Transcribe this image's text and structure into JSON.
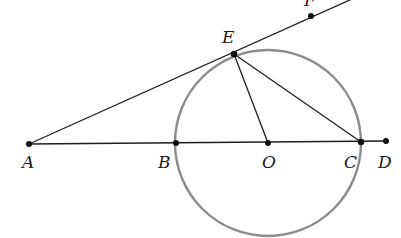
{
  "diagram": {
    "type": "geometry",
    "circle": {
      "center": "O",
      "cx": 268,
      "cy": 143,
      "r": 93,
      "stroke": "#8c8c8c"
    },
    "points": [
      {
        "id": "A",
        "label": "A",
        "x": 29,
        "y": 144,
        "label_x": 22,
        "label_y": 168
      },
      {
        "id": "B",
        "label": "B",
        "x": 176,
        "y": 143,
        "label_x": 158,
        "label_y": 168
      },
      {
        "id": "O",
        "label": "O",
        "x": 268,
        "y": 143,
        "label_x": 262,
        "label_y": 168
      },
      {
        "id": "C",
        "label": "C",
        "x": 361,
        "y": 142,
        "label_x": 344,
        "label_y": 168
      },
      {
        "id": "D",
        "label": "D",
        "x": 386,
        "y": 141,
        "label_x": 378,
        "label_y": 168
      },
      {
        "id": "E",
        "label": "E",
        "x": 234,
        "y": 54,
        "label_x": 222,
        "label_y": 43
      },
      {
        "id": "F",
        "label": "F",
        "x": 311,
        "y": 16,
        "label_x": 303,
        "label_y": 6
      }
    ],
    "segments": [
      {
        "id": "AD",
        "from": "A",
        "to": "D"
      },
      {
        "id": "AF",
        "from": "A",
        "to": "F",
        "extends_beyond": true
      },
      {
        "id": "EO",
        "from": "E",
        "to": "O"
      },
      {
        "id": "EC",
        "from": "E",
        "to": "C"
      }
    ],
    "line_color": "#1e1e1e"
  }
}
